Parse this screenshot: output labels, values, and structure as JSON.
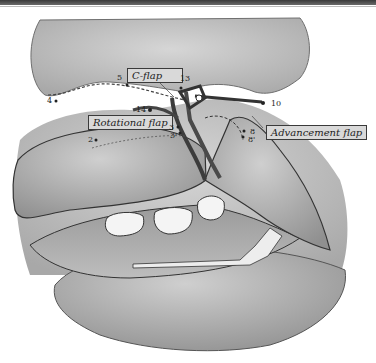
{
  "figure": {
    "labels": {
      "c_flap": "C-flap",
      "rotational_flap": "Rotational flap",
      "advancement_flap": "Advancement flap"
    },
    "points": [
      {
        "id": "2",
        "text": "2"
      },
      {
        "id": "3",
        "text": "3"
      },
      {
        "id": "3p",
        "text": "3'"
      },
      {
        "id": "4",
        "text": "4"
      },
      {
        "id": "5",
        "text": "5"
      },
      {
        "id": "8",
        "text": "8"
      },
      {
        "id": "8p",
        "text": "8'"
      },
      {
        "id": "10",
        "text": "10"
      },
      {
        "id": "13",
        "text": "13"
      },
      {
        "id": "14",
        "text": "14"
      }
    ],
    "colors": {
      "skin": "#c8c8c8",
      "skin_dark": "#9e9e9e",
      "outline": "#2a2a2a",
      "incision": "#3c3c3c",
      "tooth": "#f4f4f4",
      "label_bg": "#d9d9d9"
    }
  }
}
